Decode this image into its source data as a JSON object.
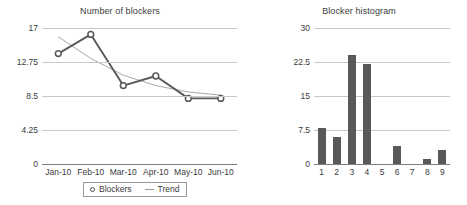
{
  "chart_data": [
    {
      "type": "line",
      "title": "Number of blockers",
      "xlabel": "",
      "ylabel": "",
      "categories": [
        "Jan-10",
        "Feb-10",
        "Mar-10",
        "Apr-10",
        "May-10",
        "Jun-10"
      ],
      "ylim": [
        0,
        17
      ],
      "yticks": [
        0,
        4.25,
        8.5,
        12.75,
        17
      ],
      "ytick_labels": [
        "0",
        "4.25",
        "8.5",
        "12.75",
        "17"
      ],
      "grid": true,
      "legend_position": "bottom",
      "series": [
        {
          "name": "Blockers",
          "marker": "circle",
          "color": "#595959",
          "values": [
            13.8,
            16.2,
            9.8,
            11.0,
            8.2,
            8.2
          ]
        },
        {
          "name": "Trend",
          "marker": "none",
          "color": "#a9a9a9",
          "values": [
            15.9,
            13.2,
            11.1,
            9.8,
            9.0,
            8.6
          ]
        }
      ]
    },
    {
      "type": "bar",
      "title": "Blocker histogram",
      "xlabel": "",
      "ylabel": "",
      "categories": [
        "1",
        "2",
        "3",
        "4",
        "5",
        "6",
        "7",
        "8",
        "9"
      ],
      "values": [
        8.0,
        6.0,
        24.0,
        22.0,
        0,
        4.0,
        0,
        1.0,
        3.0
      ],
      "ylim": [
        0,
        30
      ],
      "yticks": [
        0,
        7.5,
        15,
        22.5,
        30
      ],
      "ytick_labels": [
        "0",
        "7.5",
        "15",
        "22.5",
        "30"
      ],
      "grid": true,
      "bar_color": "#595959"
    }
  ],
  "line_chart": {
    "title": "Number of blockers",
    "legend": [
      {
        "label": "Blockers",
        "marker": "circle-marker-icon"
      },
      {
        "label": "Trend",
        "marker": "line-marker-icon"
      }
    ]
  },
  "hist_chart": {
    "title": "Blocker histogram"
  }
}
